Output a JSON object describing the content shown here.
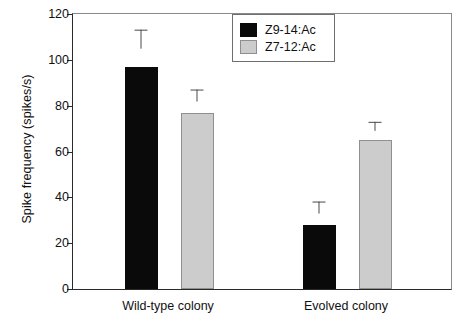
{
  "chart_data": {
    "type": "bar",
    "title": "",
    "xlabel": "",
    "ylabel": "Spike frequency (spikes/s)",
    "ylim": [
      0,
      120
    ],
    "yticks": [
      0,
      20,
      40,
      60,
      80,
      100,
      120
    ],
    "ytick_labels": [
      "0",
      "20",
      "40",
      "60",
      "80",
      "100",
      "120"
    ],
    "grid": false,
    "legend_position": "top-right",
    "categories": [
      "Wild-type colony",
      "Evolved colony"
    ],
    "series": [
      {
        "name": "Z9-14:Ac",
        "color": "#0a0a0a",
        "values": [
          97,
          28
        ],
        "errors": [
          8,
          5
        ]
      },
      {
        "name": "Z7-12:Ac",
        "color": "#cccccc",
        "values": [
          77,
          65
        ],
        "errors": [
          5,
          4
        ]
      }
    ]
  },
  "legend": {
    "entries": [
      {
        "label": "Z9-14:Ac",
        "swatch": "dark"
      },
      {
        "label": "Z7-12:Ac",
        "swatch": "light"
      }
    ]
  },
  "axes": {
    "y_title": "Spike frequency (spikes/s)",
    "y_tick_labels": [
      "120",
      "100",
      "80",
      "60",
      "40",
      "20",
      "0"
    ],
    "x_tick_labels": [
      "Wild-type colony",
      "Evolved colony"
    ]
  },
  "colors": {
    "series_dark": "#0a0a0a",
    "series_light": "#cccccc",
    "axis": "#2a2a2a",
    "frame": "#8a8a8a",
    "error_bar": "#4a4a4a",
    "background": "#ffffff"
  }
}
